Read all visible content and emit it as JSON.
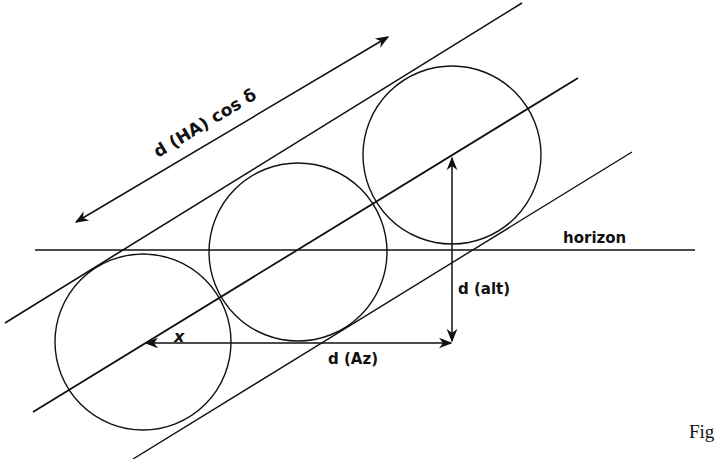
{
  "diagram": {
    "labels": {
      "hour_angle": "d (HA) cos δ",
      "horizon": "horizon",
      "altitude": "d (alt)",
      "azimuth": "d (Az)",
      "angle": "x",
      "figure": "Fig"
    },
    "colors": {
      "stroke": "#111111",
      "background": "#ffffff"
    },
    "circles": [
      {
        "id": "circle-1",
        "cx": 143,
        "cy": 342,
        "r": 88
      },
      {
        "id": "circle-2",
        "cx": 298,
        "cy": 252,
        "r": 89
      },
      {
        "id": "circle-3",
        "cx": 452,
        "cy": 155,
        "r": 89
      }
    ],
    "lines": {
      "horizon": {
        "x1": 35,
        "y1": 250,
        "x2": 695,
        "y2": 250
      },
      "upper_tangent": {
        "x1": 5,
        "y1": 323,
        "x2": 522,
        "y2": 3
      },
      "center_line": {
        "x1": 33,
        "y1": 412,
        "x2": 578,
        "y2": 78
      },
      "lower_tangent": {
        "x1": 133,
        "y1": 459,
        "x2": 632,
        "y2": 152
      }
    }
  }
}
